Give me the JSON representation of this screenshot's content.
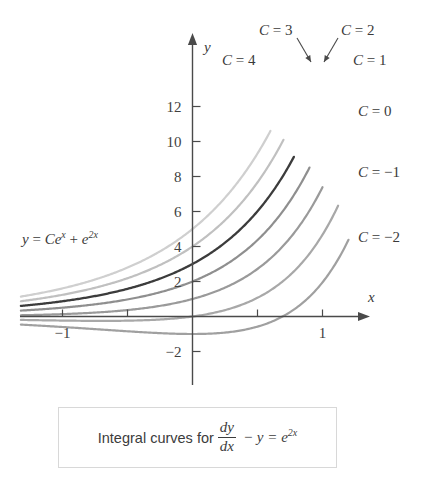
{
  "figure": {
    "equation_label": "y = Ce^x + e^2x",
    "caption": {
      "lead": "Integral curves for ",
      "frac_num": "dy",
      "frac_den": "dx",
      "tail": "− y = e",
      "tail_exp": "2x"
    }
  },
  "axes": {
    "x_axis_name": "x",
    "y_axis_name": "y",
    "x_tick_labels": [
      "−1",
      "1"
    ],
    "y_tick_labels": [
      "12",
      "10",
      "8",
      "6",
      "4",
      "2",
      "−2"
    ]
  },
  "curve_labels": [
    {
      "id": "c4",
      "text": "C = 4"
    },
    {
      "id": "c3",
      "text": "C = 3"
    },
    {
      "id": "c2",
      "text": "C = 2"
    },
    {
      "id": "c1",
      "text": "C = 1"
    },
    {
      "id": "c0",
      "text": "C = 0"
    },
    {
      "id": "cm1",
      "text": "C = −1"
    },
    {
      "id": "cm2",
      "text": "C = −2"
    }
  ],
  "chart_data": {
    "type": "line",
    "xlabel": "x",
    "ylabel": "y",
    "xlim": [
      -1.32,
      1.35
    ],
    "ylim": [
      -3.2,
      14.3
    ],
    "grid": false,
    "legend": "inline-curve-labels",
    "formula": "y = C*exp(x) + exp(2*x)",
    "x_ticks": [
      -1,
      -0.5,
      0,
      0.5,
      1
    ],
    "x_tick_labels": {
      "-1": "−1",
      "1": "1"
    },
    "y_ticks": [
      -2,
      2,
      4,
      6,
      8,
      10,
      12
    ],
    "series": [
      {
        "name": "C = 4",
        "C": 4,
        "color": "#cfcfcf",
        "width": 2.2,
        "x": [
          -1.32,
          -1.0,
          -0.75,
          -0.5,
          -0.25,
          0,
          0.25,
          0.5,
          0.6
        ],
        "y": [
          1.14,
          1.61,
          2.11,
          2.79,
          3.72,
          5.0,
          6.77,
          9.15,
          10.63
        ]
      },
      {
        "name": "C = 3",
        "C": 3,
        "color": "#c0c0c0",
        "width": 2.2,
        "x": [
          -1.32,
          -1.0,
          -0.75,
          -0.5,
          -0.25,
          0,
          0.25,
          0.5,
          0.7
        ],
        "y": [
          0.87,
          1.24,
          1.64,
          2.19,
          2.94,
          4.0,
          5.47,
          7.49,
          10.25
        ]
      },
      {
        "name": "C = 2",
        "C": 2,
        "color": "#3c3c3c",
        "width": 2.3,
        "x": [
          -1.32,
          -1.0,
          -0.75,
          -0.5,
          -0.25,
          0,
          0.25,
          0.5,
          0.78
        ],
        "y": [
          0.59,
          0.87,
          1.17,
          1.6,
          2.17,
          3.0,
          4.18,
          5.83,
          9.5
        ]
      },
      {
        "name": "C = 1",
        "C": 1,
        "color": "#8f8f8f",
        "width": 2.2,
        "x": [
          -1.32,
          -1.0,
          -0.75,
          -0.5,
          -0.25,
          0,
          0.25,
          0.5,
          0.9
        ],
        "y": [
          0.31,
          0.5,
          0.7,
          1.0,
          1.39,
          2.0,
          2.88,
          4.17,
          8.52
        ]
      },
      {
        "name": "C = 0",
        "C": 0,
        "color": "#9a9a9a",
        "width": 2.2,
        "x": [
          -1.32,
          -1.0,
          -0.75,
          -0.5,
          -0.25,
          0,
          0.25,
          0.5,
          0.75,
          1.0
        ],
        "y": [
          0.071,
          0.135,
          0.223,
          0.368,
          0.607,
          1.0,
          1.65,
          2.72,
          4.48,
          7.39
        ]
      },
      {
        "name": "C = −1",
        "C": -1,
        "color": "#a8a8a8",
        "width": 2.2,
        "x": [
          -1.32,
          -1.0,
          -0.75,
          -0.5,
          -0.25,
          0,
          0.25,
          0.5,
          0.75,
          1.0,
          1.12
        ],
        "y": [
          -0.2,
          -0.23,
          -0.25,
          -0.24,
          -0.17,
          0.0,
          0.37,
          1.08,
          2.36,
          4.67,
          6.32
        ]
      },
      {
        "name": "C = −2",
        "C": -2,
        "color": "#a0a0a0",
        "width": 2.2,
        "x": [
          -1.32,
          -1.0,
          -0.75,
          -0.5,
          -0.25,
          0,
          0.25,
          0.5,
          0.75,
          1.0,
          1.2
        ],
        "y": [
          -0.47,
          -0.6,
          -0.72,
          -0.85,
          -0.95,
          -1.0,
          -0.92,
          -0.58,
          0.25,
          1.95,
          4.41
        ]
      }
    ]
  }
}
